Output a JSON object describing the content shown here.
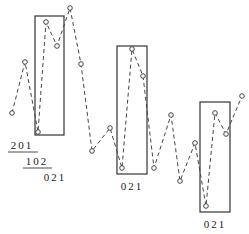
{
  "diagram": {
    "points": [
      [
        12,
        113
      ],
      [
        25,
        62
      ],
      [
        38,
        132
      ],
      [
        46,
        22
      ],
      [
        57,
        46
      ],
      [
        70,
        8
      ],
      [
        81,
        64
      ],
      [
        92,
        151
      ],
      [
        110,
        128
      ],
      [
        122,
        168
      ],
      [
        132,
        49
      ],
      [
        143,
        76
      ],
      [
        154,
        168
      ],
      [
        171,
        115
      ],
      [
        180,
        181
      ],
      [
        195,
        143
      ],
      [
        206,
        206
      ],
      [
        215,
        113
      ],
      [
        226,
        134
      ],
      [
        242,
        96
      ]
    ],
    "boxes": [
      {
        "x": 35,
        "y": 16,
        "w": 29,
        "h": 119
      },
      {
        "x": 117,
        "y": 46,
        "w": 30,
        "h": 128
      },
      {
        "x": 200,
        "y": 102,
        "w": 30,
        "h": 110
      }
    ],
    "labels": [
      {
        "text": "201",
        "x": 22,
        "y": 149,
        "underline": [
          8,
          38,
          152
        ]
      },
      {
        "text": "102",
        "x": 37,
        "y": 165,
        "underline": [
          23,
          52,
          168
        ]
      },
      {
        "text": "021",
        "x": 55,
        "y": 181
      },
      {
        "text": "021",
        "x": 132,
        "y": 190
      },
      {
        "text": "021",
        "x": 215,
        "y": 228
      }
    ],
    "colors": {
      "line": "#444444",
      "box": "#333333",
      "text": "#222222"
    }
  }
}
